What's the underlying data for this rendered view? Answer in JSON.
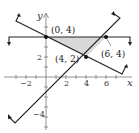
{
  "diagram": {
    "type": "system-of-inequalities-graph",
    "axes": {
      "x_label": "x",
      "y_label": "y",
      "x_ticks": [
        "−2",
        "2",
        "4",
        "6"
      ],
      "y_ticks": [
        "2",
        "−4"
      ]
    },
    "boundary_lines": [
      {
        "name": "horizontal",
        "equation": "y = 4"
      },
      {
        "name": "decreasing",
        "equation": "y = -x/2 + 4"
      },
      {
        "name": "increasing",
        "equation": "y = x - 2"
      }
    ],
    "vertices": [
      {
        "label": "(0, 4)",
        "x": 0,
        "y": 4
      },
      {
        "label": "(4, 2)",
        "x": 4,
        "y": 2
      },
      {
        "label": "(6, 4)",
        "x": 6,
        "y": 4
      }
    ],
    "shaded_region": {
      "vertices": [
        [
          0,
          4
        ],
        [
          6,
          4
        ],
        [
          4,
          2
        ]
      ],
      "color": "#d8d8d8"
    },
    "colors": {
      "line": "#222222",
      "axis": "#666666",
      "shade": "#d8d8d8"
    }
  }
}
